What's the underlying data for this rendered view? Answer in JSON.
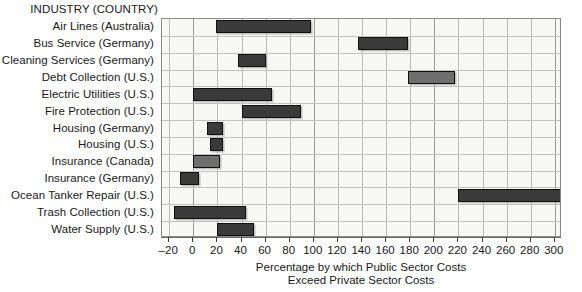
{
  "chart_data": {
    "type": "bar",
    "orientation": "horizontal-range",
    "title": "",
    "header_label": "INDUSTRY (COUNTRY)",
    "xlabel_line1": "Percentage by which Public Sector Costs",
    "xlabel_line2": "Exceed Private Sector Costs",
    "ylabel": "INDUSTRY (COUNTRY)",
    "xlim": [
      -30,
      302
    ],
    "xticks": [
      -20,
      0,
      20,
      40,
      60,
      80,
      100,
      120,
      140,
      160,
      180,
      200,
      220,
      240,
      260,
      280,
      300
    ],
    "xtick_labels": [
      "–20",
      "0",
      "20",
      "40",
      "60",
      "80",
      "100",
      "120",
      "140",
      "160",
      "180",
      "200",
      "220",
      "240",
      "260",
      "280",
      "300"
    ],
    "grid": true,
    "legend": "none",
    "categories": [
      "Air Lines (Australia)",
      "Bus Service (Germany)",
      "Cleaning Services (Germany)",
      "Debt Collection (U.S.)",
      "Electric Utilities (U.S.)",
      "Fire Protection (U.S.)",
      "Housing (Germany)",
      "Housing (U.S.)",
      "Insurance (Canada)",
      "Insurance (Germany)",
      "Ocean Tanker Repair (U.S.)",
      "Trash Collection (U.S.)",
      "Water Supply (U.S.)"
    ],
    "bars": [
      {
        "category": "Air Lines (Australia)",
        "low": 19,
        "high": 98,
        "shade": "dark"
      },
      {
        "category": "Bus Service (Germany)",
        "low": 137,
        "high": 178,
        "shade": "dark"
      },
      {
        "category": "Cleaning Services (Germany)",
        "low": 37,
        "high": 60,
        "shade": "dark"
      },
      {
        "category": "Debt Collection (U.S.)",
        "low": 178,
        "high": 217,
        "shade": "light"
      },
      {
        "category": "Electric Utilities (U.S.)",
        "low": 0,
        "high": 65,
        "shade": "dark"
      },
      {
        "category": "Fire Protection (U.S.)",
        "low": 40,
        "high": 89,
        "shade": "dark"
      },
      {
        "category": "Housing (Germany)",
        "low": 11,
        "high": 25,
        "shade": "dark"
      },
      {
        "category": "Housing (U.S.)",
        "low": 14,
        "high": 25,
        "shade": "dark"
      },
      {
        "category": "Insurance (Canada)",
        "low": 0,
        "high": 22,
        "shade": "light"
      },
      {
        "category": "Insurance (Germany)",
        "low": -11,
        "high": 5,
        "shade": "dark"
      },
      {
        "category": "Ocean Tanker Repair (U.S.)",
        "low": 220,
        "high": 310,
        "shade": "dark"
      },
      {
        "category": "Trash Collection (U.S.)",
        "low": -16,
        "high": 44,
        "shade": "dark"
      },
      {
        "category": "Water Supply (U.S.)",
        "low": 20,
        "high": 50,
        "shade": "dark"
      }
    ],
    "colors": {
      "bar_dark": "#3a3a3a",
      "bar_light": "#6e6e6e",
      "plot_background": "#f7f7f5",
      "grid": "#b9b9b9",
      "axis": "#6a6a6a",
      "text": "#181818"
    }
  }
}
